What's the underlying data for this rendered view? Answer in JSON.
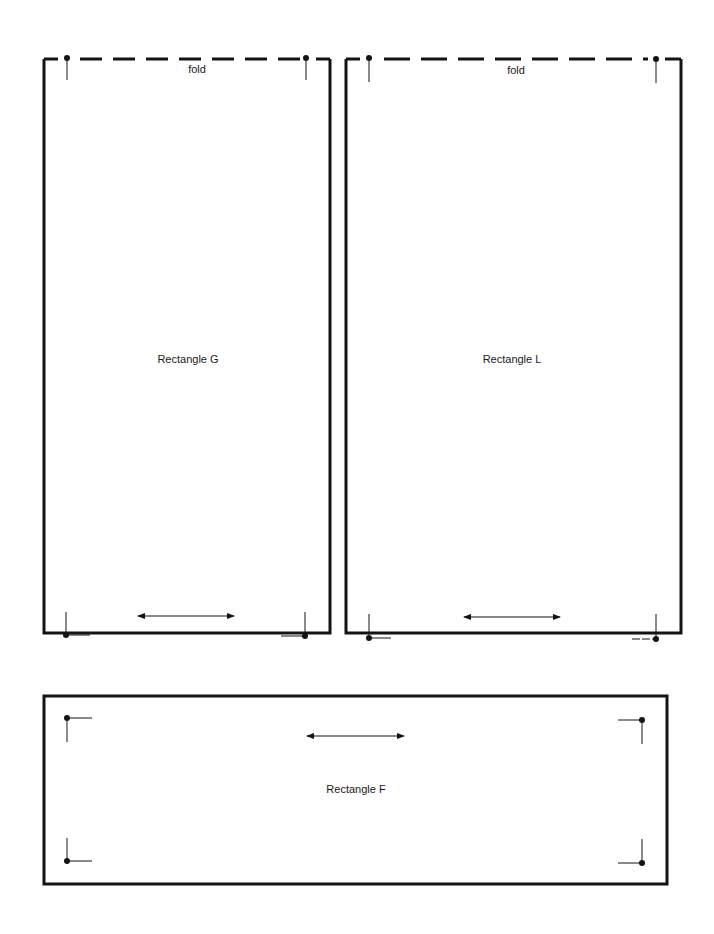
{
  "colors": {
    "ink": "#141414",
    "paper": "#ffffff"
  },
  "rectangles": [
    {
      "id": "G",
      "label": "Rectangle G",
      "fold_label": "fold",
      "has_fold": true,
      "x": 44,
      "y": 59,
      "w": 286,
      "h": 574,
      "grain_arrow": "horizontal"
    },
    {
      "id": "L",
      "label": "Rectangle L",
      "fold_label": "fold",
      "has_fold": true,
      "x": 345,
      "y": 59,
      "w": 336,
      "h": 574,
      "grain_arrow": "horizontal"
    },
    {
      "id": "F",
      "label": "Rectangle F",
      "has_fold": false,
      "x": 44,
      "y": 696,
      "w": 623,
      "h": 188,
      "grain_arrow": "horizontal"
    }
  ],
  "labels": {
    "g_title": "Rectangle G",
    "l_title": "Rectangle L",
    "f_title": "Rectangle F",
    "g_fold": "fold",
    "l_fold": "fold"
  }
}
